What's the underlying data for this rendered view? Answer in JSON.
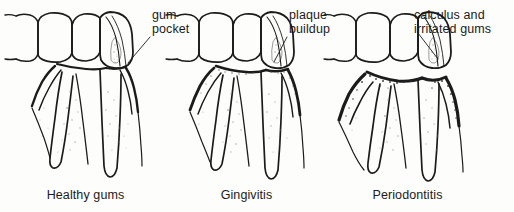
{
  "figure": {
    "background_color": "#fdfdfb",
    "ink_color": "#1b1b1b",
    "style": "pen-and-ink line drawing, scanned"
  },
  "panels": [
    {
      "id": "healthy-gums",
      "caption": "Healthy gums",
      "annotation": {
        "line1": "gum",
        "line2": "pocket"
      },
      "gum_recession": "none",
      "deposit": "none"
    },
    {
      "id": "gingivitis",
      "caption": "Gingivitis",
      "annotation": {
        "line1": "plaque",
        "line2": "buildup"
      },
      "gum_recession": "mild",
      "deposit": "plaque"
    },
    {
      "id": "periodontitis",
      "caption": "Periodontitis",
      "annotation": {
        "line1": "calculus and",
        "line2": "irritated gums"
      },
      "gum_recession": "severe",
      "deposit": "calculus"
    }
  ]
}
